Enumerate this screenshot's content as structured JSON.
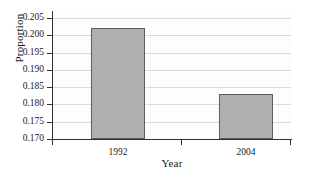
{
  "chart_data": {
    "type": "bar",
    "title": "",
    "xlabel": "Year",
    "ylabel": "Proportion",
    "categories": [
      "1992",
      "2004"
    ],
    "values": [
      0.2022,
      0.183
    ],
    "ylim": [
      0.17,
      0.205
    ],
    "ytick_labels": [
      "0.205",
      "0.200",
      "0.195",
      "0.190",
      "0.185",
      "0.180",
      "0.175",
      "0.170"
    ],
    "ytick_values": [
      0.205,
      0.2,
      0.195,
      0.19,
      0.185,
      0.18,
      0.175,
      0.17
    ],
    "ystep": 0.005,
    "grid": true,
    "legend": false,
    "legend_position": "none",
    "bar_fill_color": "#b0b0b0",
    "bar_edge_color": "#5e5e5e",
    "grid_color": "#d9d9d9",
    "axis_color": "#303030",
    "background_color": "#ffffff"
  }
}
